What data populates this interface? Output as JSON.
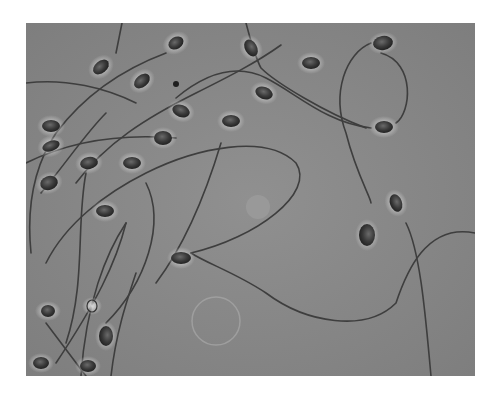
{
  "image": {
    "subject": "phase-contrast micrograph of sperm cells",
    "colors": {
      "background": "#8a8a8a",
      "head_dark": "#3a3a3a",
      "halo": "#d8d8d8",
      "tail": "#3e3e3e",
      "page": "#ffffff"
    }
  }
}
